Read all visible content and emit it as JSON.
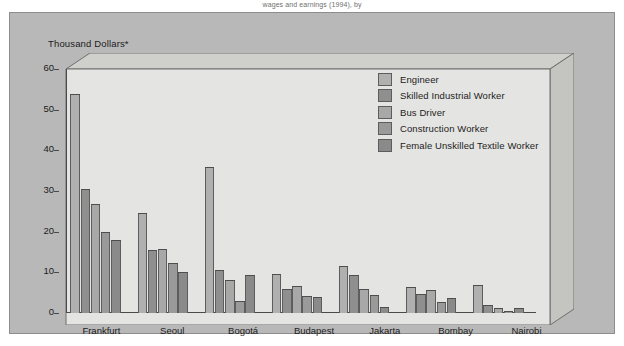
{
  "caption": {
    "top_note": "wages and earnings (1994), by"
  },
  "chart_data": {
    "type": "bar",
    "title": "",
    "subtitle": "",
    "xlabel": "",
    "ylabel": "Thousand Dollars*",
    "ylim": [
      0,
      60
    ],
    "yticks": [
      0,
      10,
      20,
      30,
      40,
      50,
      60
    ],
    "ytick_labels": [
      "0",
      "10",
      "20",
      "30",
      "40",
      "50",
      "60"
    ],
    "grid": false,
    "legend_position": "upper-right",
    "categories": [
      "Frankfurt",
      "Seoul",
      "Bogotá",
      "Budapest",
      "Jakarta",
      "Bombay",
      "Nairobi"
    ],
    "series": [
      {
        "name": "Engineer",
        "color": "#b0b0b0",
        "values": [
          53.8,
          24.6,
          35.8,
          9.7,
          11.6,
          6.3,
          6.9
        ]
      },
      {
        "name": "Skilled Industrial Worker",
        "color": "#8f8f8f",
        "values": [
          30.4,
          15.5,
          10.5,
          5.8,
          9.4,
          4.6,
          2.0
        ]
      },
      {
        "name": "Bus Driver",
        "color": "#a8a8a8",
        "values": [
          26.9,
          15.8,
          8.0,
          6.7,
          5.9,
          5.6,
          1.3
        ]
      },
      {
        "name": "Construction Worker",
        "color": "#9a9a9a",
        "values": [
          19.8,
          12.3,
          3.0,
          4.2,
          4.4,
          2.7,
          0.4
        ]
      },
      {
        "name": "Female Unskilled Textile Worker",
        "color": "#8a8a8a",
        "values": [
          18.0,
          10.0,
          9.3,
          4.0,
          1.5,
          3.8,
          1.3
        ]
      }
    ]
  },
  "legend": {
    "items": [
      {
        "label": "Engineer",
        "color": "#b0b0b0"
      },
      {
        "label": "Skilled Industrial Worker",
        "color": "#8f8f8f"
      },
      {
        "label": "Bus Driver",
        "color": "#a8a8a8"
      },
      {
        "label": "Construction Worker",
        "color": "#9a9a9a"
      },
      {
        "label": "Female Unskilled Textile Worker",
        "color": "#8a8a8a"
      }
    ]
  },
  "colors": {
    "frame_bg": "#b8b8b8",
    "plot_floor": "#e2e2e0",
    "plot_wall": "#d0d0cd",
    "axis": "#4a4a4a",
    "text": "#1c1c1c"
  }
}
